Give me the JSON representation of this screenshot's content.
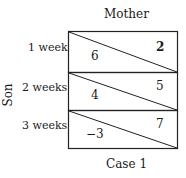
{
  "diagram": {
    "column_player": "Mother",
    "row_player": "Son",
    "caption": "Case 1",
    "rows": [
      {
        "label": "1 week",
        "son_payoff": "6",
        "mother_payoff": "2"
      },
      {
        "label": "2 weeks",
        "son_payoff": "4",
        "mother_payoff": "5"
      },
      {
        "label": "3 weeks",
        "son_payoff": "−3",
        "mother_payoff": "7"
      }
    ]
  }
}
